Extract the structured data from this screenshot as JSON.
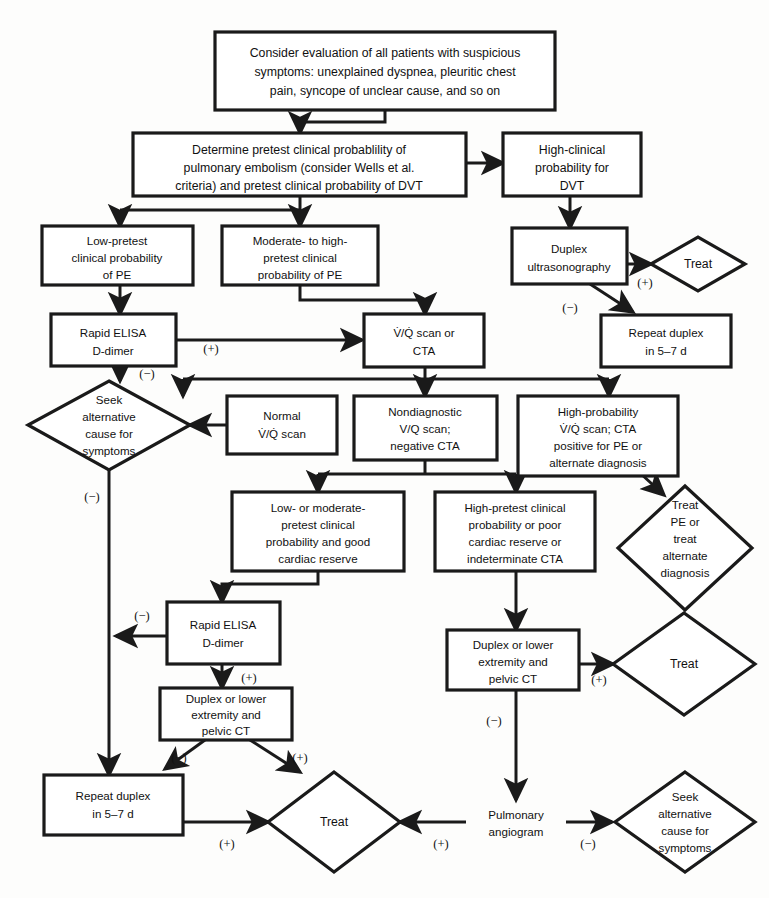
{
  "diagram": {
    "type": "clinical-flowchart",
    "colors": {
      "stroke": "#1a1a1a",
      "fill": "#ffffff",
      "background": "#fdfdfc"
    },
    "nodes": [
      {
        "id": "n1",
        "shape": "box",
        "lines": [
          "Consider evaluation of all patients with suspicious",
          "symptoms: unexplained dyspnea, pleuritic chest",
          "pain, syncope of unclear cause, and so on"
        ]
      },
      {
        "id": "n2",
        "shape": "box",
        "lines": [
          "Determine pretest clinical probablility of",
          "pulmonary embolism (consider Wells et al.",
          "criteria) and pretest clinical probability of DVT"
        ]
      },
      {
        "id": "n3",
        "shape": "box",
        "lines": [
          "High-clinical",
          "probability for",
          "DVT"
        ]
      },
      {
        "id": "n4",
        "shape": "box",
        "lines": [
          "Low-pretest",
          "clinical probability",
          "of PE"
        ]
      },
      {
        "id": "n5",
        "shape": "box",
        "lines": [
          "Moderate- to high-",
          "pretest clinical",
          "probability of PE"
        ]
      },
      {
        "id": "n6",
        "shape": "box",
        "lines": [
          "Duplex",
          "ultrasonography"
        ]
      },
      {
        "id": "n7",
        "shape": "diamond",
        "lines": [
          "Treat"
        ]
      },
      {
        "id": "n8",
        "shape": "box",
        "lines": [
          "Rapid ELISA",
          "D-dimer"
        ]
      },
      {
        "id": "n9",
        "shape": "box",
        "lines": [
          "V̇/Q̇ scan or",
          "CTA"
        ]
      },
      {
        "id": "n10",
        "shape": "box",
        "lines": [
          "Repeat duplex",
          "in 5–7 d"
        ]
      },
      {
        "id": "n11",
        "shape": "diamond",
        "lines": [
          "Seek",
          "alternative",
          "cause for",
          "symptoms"
        ]
      },
      {
        "id": "n12",
        "shape": "box",
        "lines": [
          "Normal",
          "V̇/Q̇ scan"
        ]
      },
      {
        "id": "n13",
        "shape": "box",
        "lines": [
          "Nondiagnostic",
          "V/Q scan;",
          "negative CTA"
        ]
      },
      {
        "id": "n14",
        "shape": "box",
        "lines": [
          "High-probability",
          "V̇/Q̇ scan; CTA",
          "positive for PE or",
          "alternate diagnosis"
        ]
      },
      {
        "id": "n15",
        "shape": "diamond",
        "lines": [
          "Treat",
          "PE or",
          "treat",
          "alternate",
          "diagnosis"
        ]
      },
      {
        "id": "n16",
        "shape": "box",
        "lines": [
          "Low- or moderate-",
          "pretest clinical",
          "probability and good",
          "cardiac reserve"
        ]
      },
      {
        "id": "n17",
        "shape": "box",
        "lines": [
          "High-pretest clinical",
          "probability or poor",
          "cardiac reserve or",
          "indeterminate CTA"
        ]
      },
      {
        "id": "n18",
        "shape": "box",
        "lines": [
          "Rapid ELISA",
          "D-dimer"
        ]
      },
      {
        "id": "n19",
        "shape": "box",
        "lines": [
          "Duplex or lower",
          "extremity and",
          "pelvic CT"
        ]
      },
      {
        "id": "n20",
        "shape": "diamond",
        "lines": [
          "Treat"
        ]
      },
      {
        "id": "n21",
        "shape": "box",
        "lines": [
          "Duplex or lower",
          "extremity and",
          "pelvic CT"
        ]
      },
      {
        "id": "n22",
        "shape": "box",
        "lines": [
          "Repeat duplex",
          "in 5–7 d"
        ]
      },
      {
        "id": "n23",
        "shape": "diamond",
        "lines": [
          "Treat"
        ]
      },
      {
        "id": "n24",
        "shape": "text",
        "lines": [
          "Pulmonary",
          "angiogram"
        ]
      },
      {
        "id": "n25",
        "shape": "diamond",
        "lines": [
          "Seek",
          "alternative",
          "cause for",
          "symptoms"
        ]
      }
    ],
    "edge_labels": [
      {
        "id": "e_dup_pos",
        "text": "(+)"
      },
      {
        "id": "e_dup_neg",
        "text": "(−)"
      },
      {
        "id": "e_elisa_pos",
        "text": "(+)"
      },
      {
        "id": "e_elisa_neg",
        "text": "(−)"
      },
      {
        "id": "e_seek_neg",
        "text": "(−)"
      },
      {
        "id": "e_elisa2_neg",
        "text": "(−)"
      },
      {
        "id": "e_elisa2_pos",
        "text": "(+)"
      },
      {
        "id": "e_ct1_neg",
        "text": "(−)"
      },
      {
        "id": "e_ct1_pos",
        "text": "(+)"
      },
      {
        "id": "e_ct2_pos",
        "text": "(+)"
      },
      {
        "id": "e_ct2_neg",
        "text": "(−)"
      },
      {
        "id": "e_rep_pos",
        "text": "(+)"
      },
      {
        "id": "e_ang_pos",
        "text": "(+)"
      },
      {
        "id": "e_ang_neg",
        "text": "(−)"
      }
    ]
  }
}
